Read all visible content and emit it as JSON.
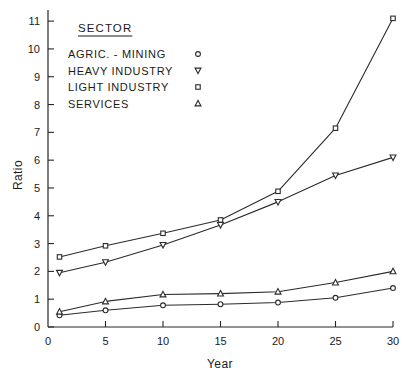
{
  "chart_data": {
    "type": "line",
    "title": "",
    "xlabel": "Year",
    "ylabel": "Ratio",
    "xlim": [
      0,
      30
    ],
    "ylim": [
      0,
      11.4
    ],
    "grid": false,
    "x": [
      1,
      5,
      10,
      15,
      20,
      25,
      30
    ],
    "xticks": [
      0,
      5,
      10,
      15,
      20,
      25,
      30
    ],
    "xtick_labels": [
      "0",
      "5",
      "10",
      "15",
      "20",
      "25",
      "30"
    ],
    "yticks": [
      0,
      1,
      2,
      3,
      4,
      5,
      6,
      7,
      8,
      9,
      10,
      11
    ],
    "ytick_labels": [
      "0",
      "1",
      "2",
      "3",
      "4",
      "5",
      "6",
      "7",
      "8",
      "9",
      "10",
      "11"
    ],
    "legend_position": "upper-left",
    "legend_title": "SECTOR",
    "series": [
      {
        "name": "AGRIC. - MINING",
        "marker": "circle",
        "values": [
          0.42,
          0.6,
          0.78,
          0.82,
          0.88,
          1.05,
          1.4
        ]
      },
      {
        "name": "HEAVY INDUSTRY",
        "marker": "triangle-down",
        "values": [
          1.95,
          2.33,
          2.95,
          3.67,
          4.5,
          5.45,
          6.1
        ]
      },
      {
        "name": "LIGHT INDUSTRY",
        "marker": "square",
        "values": [
          2.52,
          2.92,
          3.37,
          3.85,
          4.88,
          7.15,
          11.1
        ]
      },
      {
        "name": "SERVICES",
        "marker": "triangle-up",
        "values": [
          0.55,
          0.92,
          1.17,
          1.2,
          1.27,
          1.6,
          2.0
        ]
      }
    ]
  },
  "colors": {
    "ink": "#262626",
    "marker_fill": "#ffffff",
    "background": "#ffffff"
  }
}
